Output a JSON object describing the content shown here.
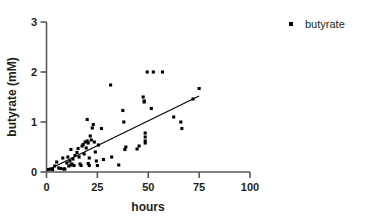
{
  "chart_data": {
    "type": "scatter",
    "title": "",
    "xlabel": "hours",
    "ylabel": "butyrate (mM)",
    "xlim": [
      0,
      100
    ],
    "ylim": [
      0,
      3
    ],
    "xticks": [
      0,
      25,
      50,
      75,
      100
    ],
    "yticks": [
      0,
      1,
      2,
      3
    ],
    "xticklabels": [
      "0",
      "25",
      "50",
      "75",
      "100"
    ],
    "yticklabels": [
      "0",
      "1",
      "2",
      "3"
    ],
    "grid": false,
    "legend": {
      "position": "top-right",
      "entries": [
        {
          "label": "butyrate",
          "marker": "square",
          "color": "#000000"
        }
      ]
    },
    "series": [
      {
        "name": "butyrate",
        "marker": "square",
        "color": "#000000",
        "points": [
          [
            1.0,
            0.05
          ],
          [
            2.0,
            0.06
          ],
          [
            3.0,
            0.05
          ],
          [
            4.0,
            0.12
          ],
          [
            5.0,
            0.2
          ],
          [
            6.0,
            0.08
          ],
          [
            7.0,
            0.07
          ],
          [
            8.0,
            0.28
          ],
          [
            8.5,
            0.06
          ],
          [
            9.0,
            0.06
          ],
          [
            10.0,
            0.18
          ],
          [
            10.5,
            0.3
          ],
          [
            11.0,
            0.12
          ],
          [
            11.5,
            0.22
          ],
          [
            12.0,
            0.14
          ],
          [
            12.0,
            0.45
          ],
          [
            12.5,
            0.16
          ],
          [
            13.0,
            0.26
          ],
          [
            13.5,
            0.13
          ],
          [
            14.0,
            0.33
          ],
          [
            15.0,
            0.39
          ],
          [
            15.5,
            0.47
          ],
          [
            16.0,
            0.3
          ],
          [
            16.5,
            0.16
          ],
          [
            17.0,
            0.13
          ],
          [
            17.5,
            0.52
          ],
          [
            18.0,
            0.55
          ],
          [
            18.5,
            0.36
          ],
          [
            19.0,
            0.6
          ],
          [
            19.5,
            0.48
          ],
          [
            20.0,
            1.05
          ],
          [
            20.0,
            0.62
          ],
          [
            20.5,
            0.58
          ],
          [
            20.5,
            0.17
          ],
          [
            21.0,
            0.28
          ],
          [
            21.0,
            0.13
          ],
          [
            21.5,
            0.72
          ],
          [
            22.0,
            0.64
          ],
          [
            22.5,
            0.88
          ],
          [
            23.0,
            0.95
          ],
          [
            23.5,
            0.6
          ],
          [
            24.0,
            0.4
          ],
          [
            24.5,
            0.22
          ],
          [
            25.0,
            0.13
          ],
          [
            25.5,
            0.54
          ],
          [
            27.0,
            0.87
          ],
          [
            28.0,
            0.25
          ],
          [
            31.5,
            1.74
          ],
          [
            32.0,
            0.3
          ],
          [
            35.5,
            0.14
          ],
          [
            37.5,
            1.23
          ],
          [
            38.0,
            1.0
          ],
          [
            38.5,
            0.45
          ],
          [
            39.0,
            0.5
          ],
          [
            44.5,
            0.46
          ],
          [
            45.5,
            0.52
          ],
          [
            47.5,
            1.5
          ],
          [
            48.0,
            1.4
          ],
          [
            48.0,
            1.42
          ],
          [
            48.5,
            0.62
          ],
          [
            48.5,
            0.7
          ],
          [
            48.5,
            0.58
          ],
          [
            48.5,
            0.78
          ],
          [
            49.5,
            2.0
          ],
          [
            51.5,
            1.27
          ],
          [
            52.5,
            2.0
          ],
          [
            57.0,
            2.0
          ],
          [
            62.5,
            1.1
          ],
          [
            66.0,
            1.0
          ],
          [
            66.5,
            0.87
          ],
          [
            72.0,
            1.46
          ],
          [
            75.0,
            1.67
          ]
        ]
      }
    ],
    "fit_line": {
      "type": "linear-regression",
      "x_start": 0.5,
      "y_start": 0.04,
      "x_end": 75.0,
      "y_end": 1.52
    }
  },
  "legend": {
    "butyrate_label": "butyrate"
  },
  "axes": {
    "x_title": "hours",
    "y_title": "butyrate (mM)"
  }
}
